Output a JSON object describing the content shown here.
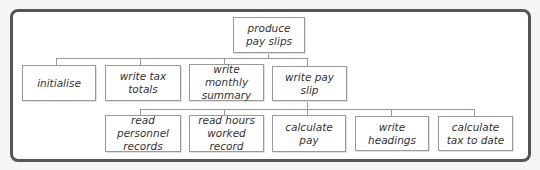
{
  "diagram": {
    "type": "structure-chart",
    "root": {
      "label": "produce\npay slips"
    },
    "level1": [
      {
        "label": "initialise"
      },
      {
        "label": "write tax totals"
      },
      {
        "label": "write monthly summary"
      },
      {
        "label": "write pay slip"
      }
    ],
    "level2_parent": "write pay slip",
    "level2": [
      {
        "label": "read personnel records"
      },
      {
        "label": "read hours worked record"
      },
      {
        "label": "calculate pay"
      },
      {
        "label": "write headings"
      },
      {
        "label": "calculate tax to date"
      }
    ]
  }
}
